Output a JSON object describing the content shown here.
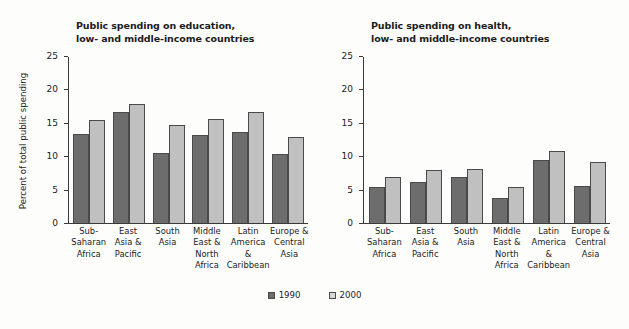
{
  "figure": {
    "background": "#fdfdfc",
    "series_colors": {
      "1990": "#6d6d6d",
      "2000": "#c0c0c0"
    }
  },
  "legend": {
    "items": [
      {
        "label": "1990",
        "key": "1990"
      },
      {
        "label": "2000",
        "key": "2000"
      }
    ]
  },
  "chart_data": [
    {
      "type": "bar",
      "title": "Public spending on education, low- and middle-income countries",
      "title_lines": [
        "Public spending on education,",
        "low- and middle-income countries"
      ],
      "xlabel": "",
      "ylabel": "Percent of total public spending",
      "ylim": [
        0,
        25
      ],
      "yticks": [
        0,
        5,
        10,
        15,
        20,
        25
      ],
      "ytick_labels": [
        "0",
        "5",
        "10",
        "15",
        "20",
        "25"
      ],
      "grid": false,
      "legend_position": "bottom-center",
      "categories": [
        "Sub-Saharan Africa",
        "East Asia & Pacific",
        "South Asia",
        "Middle East & North Africa",
        "Latin America & Caribbean",
        "Europe & Central Asia"
      ],
      "category_lines": [
        [
          "Sub-",
          "Saharan",
          "Africa"
        ],
        [
          "East",
          "Asia &",
          "Pacific"
        ],
        [
          "South",
          "Asia"
        ],
        [
          "Middle",
          "East &",
          "North",
          "Africa"
        ],
        [
          "Latin",
          "America",
          "&",
          "Caribbean"
        ],
        [
          "Europe &",
          "Central",
          "Asia"
        ]
      ],
      "series": [
        {
          "name": "1990",
          "values": [
            13.4,
            16.7,
            10.6,
            13.3,
            13.7,
            10.4
          ]
        },
        {
          "name": "2000",
          "values": [
            15.5,
            17.9,
            14.8,
            15.7,
            16.7,
            13.0
          ]
        }
      ]
    },
    {
      "type": "bar",
      "title": "Public spending on health, low- and middle-income countries",
      "title_lines": [
        "Public spending on health,",
        "low- and middle-income countries"
      ],
      "xlabel": "",
      "ylabel": "",
      "ylim": [
        0,
        25
      ],
      "yticks": [
        0,
        5,
        10,
        15,
        20,
        25
      ],
      "ytick_labels": [
        "0",
        "5",
        "10",
        "15",
        "20",
        "25"
      ],
      "grid": false,
      "legend_position": "bottom-center",
      "categories": [
        "Sub-Saharan Africa",
        "East Asia & Pacific",
        "South Asia",
        "Middle East & North Africa",
        "Latin America & Caribbean",
        "Europe & Central Asia"
      ],
      "category_lines": [
        [
          "Sub-",
          "Saharan",
          "Africa"
        ],
        [
          "East",
          "Asia &",
          "Pacific"
        ],
        [
          "South",
          "Asia"
        ],
        [
          "Middle",
          "East &",
          "North",
          "Africa"
        ],
        [
          "Latin",
          "America",
          "&",
          "Caribbean"
        ],
        [
          "Europe &",
          "Central",
          "Asia"
        ]
      ],
      "series": [
        {
          "name": "1990",
          "values": [
            5.4,
            6.2,
            7.0,
            3.8,
            9.5,
            5.5
          ]
        },
        {
          "name": "2000",
          "values": [
            6.9,
            8.0,
            8.2,
            5.4,
            10.9,
            9.2
          ]
        }
      ]
    }
  ]
}
